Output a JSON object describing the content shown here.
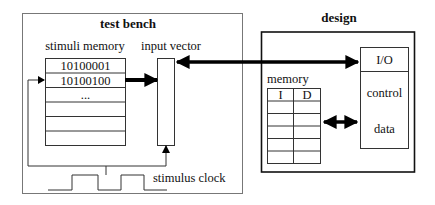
{
  "test_bench": {
    "title": "test bench",
    "stimuli_memory_label": "stimuli memory",
    "stimuli_rows": [
      "10100001",
      "10100100",
      "...",
      "",
      "",
      ""
    ],
    "input_vector_label": "input vector",
    "stimulus_clock_label": "stimulus clock"
  },
  "design": {
    "title": "design",
    "memory_label": "memory",
    "memory_columns": [
      "I",
      "D"
    ],
    "memory_empty_rows": 5,
    "io_block": {
      "io_label": "I/O",
      "control_label": "control",
      "data_label": "data"
    }
  },
  "colors": {
    "test_bench_border": "#777777",
    "design_border": "#111111",
    "line": "#222222",
    "arrow": "#000000"
  }
}
